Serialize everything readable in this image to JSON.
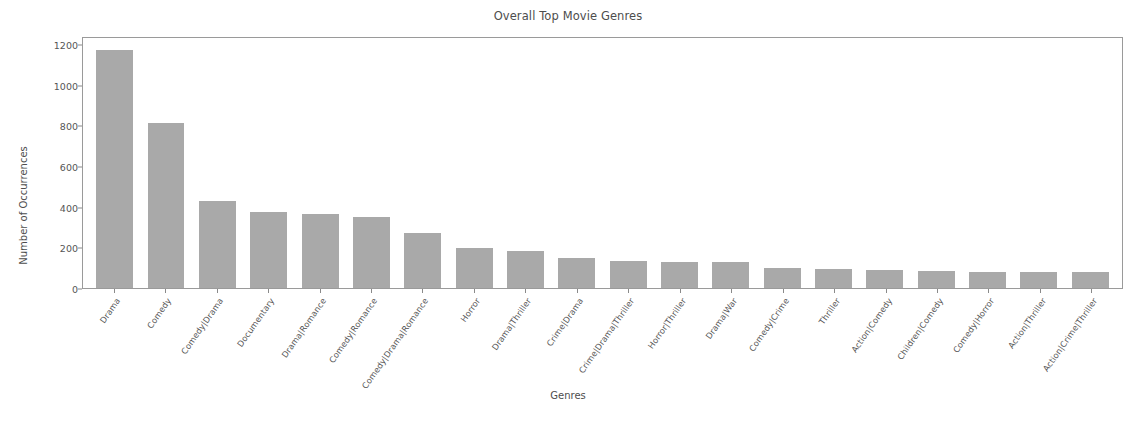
{
  "chart_data": {
    "type": "bar",
    "title": "Overall Top Movie Genres",
    "xlabel": "Genres",
    "ylabel": "Number of Occurrences",
    "grid": false,
    "legend": false,
    "ylim": [
      0,
      1240
    ],
    "yticks": [
      0,
      200,
      400,
      600,
      800,
      1000,
      1200
    ],
    "ytick_labels": [
      "0",
      "200",
      "400",
      "600",
      "800",
      "1000",
      "1200"
    ],
    "bar_color": "#a9a9a9",
    "categories": [
      "Drama",
      "Comedy",
      "Comedy|Drama",
      "Documentary",
      "Drama|Romance",
      "Comedy|Romance",
      "Comedy|Drama|Romance",
      "Horror",
      "Drama|Thriller",
      "Crime|Drama",
      "Crime|Drama|Thriller",
      "Horror|Thriller",
      "Drama|War",
      "Comedy|Crime",
      "Thriller",
      "Action|Comedy",
      "Children|Comedy",
      "Comedy|Horror",
      "Action|Thriller",
      "Action|Crime|Thriller"
    ],
    "values": [
      1172,
      812,
      428,
      372,
      363,
      350,
      272,
      196,
      184,
      149,
      135,
      130,
      128,
      97,
      94,
      88,
      84,
      81,
      81,
      77
    ]
  },
  "figure": {
    "background": "#ffffff",
    "axes_edge_color": "#9a9a9a",
    "text_color": "#4d4d4d"
  }
}
